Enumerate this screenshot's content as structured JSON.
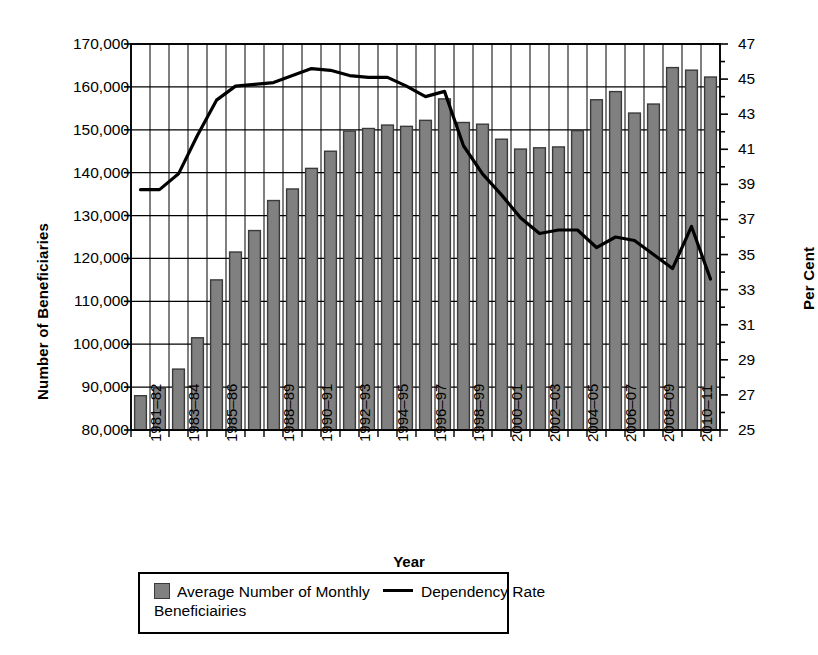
{
  "chart_data": {
    "type": "bar",
    "title": "",
    "xlabel": "Year",
    "ylabel": "Number of Beneficiaries",
    "y2label": "Per Cent",
    "grid": true,
    "legend_position": "bottom",
    "categories": [
      "1981–82",
      "1982–83",
      "1983–84",
      "1984–85",
      "1985–86",
      "1986–87",
      "1987–88",
      "1988–89",
      "1989–90",
      "1990–91",
      "1991–92",
      "1992–93",
      "1993–94",
      "1994–95",
      "1995–96",
      "1996–97",
      "1997–98",
      "1998–99",
      "1999–00",
      "2000–01",
      "2001–02",
      "2002–03",
      "2003–04",
      "2004–05",
      "2005–06",
      "2006–07",
      "2007–08",
      "2008–09",
      "2009–10",
      "2010–11",
      "2011–12"
    ],
    "xtick_labels": [
      "1981–82",
      "1983–84",
      "1985–86",
      "1988–89",
      "1990–91",
      "1992–93",
      "1994–95",
      "1996–97",
      "1998–99",
      "2000–01",
      "2002–03",
      "2004–05",
      "2006–07",
      "2008–09",
      "2010–11"
    ],
    "xtick_indices": [
      0,
      2,
      4,
      7,
      9,
      11,
      13,
      15,
      17,
      19,
      21,
      23,
      25,
      27,
      29
    ],
    "ylim": [
      80000,
      170000
    ],
    "ytick_values": [
      80000,
      90000,
      100000,
      110000,
      120000,
      130000,
      140000,
      150000,
      160000,
      170000
    ],
    "ytick_labels": [
      "80,000",
      "90,000",
      "100,000",
      "110,000",
      "120,000",
      "130,000",
      "140,000",
      "150,000",
      "160,000",
      "170,000"
    ],
    "y2lim": [
      25,
      47
    ],
    "y2tick_values": [
      25,
      27,
      29,
      31,
      33,
      35,
      37,
      39,
      41,
      43,
      45,
      47
    ],
    "y2tick_labels": [
      "25",
      "27",
      "29",
      "31",
      "33",
      "35",
      "37",
      "39",
      "41",
      "43",
      "45",
      "47"
    ],
    "y2_minor_step": 1,
    "series": [
      {
        "name": "Average Number of Monthly Beneficiairies",
        "type": "bar",
        "axis": "left",
        "color": "#808080",
        "edge_color": "#3a3a3a",
        "values": [
          88000,
          89800,
          94200,
          101500,
          115000,
          121500,
          126500,
          133500,
          136200,
          141000,
          145000,
          149700,
          150300,
          151100,
          150800,
          152200,
          157200,
          151700,
          151300,
          147800,
          145500,
          145800,
          146000,
          149800,
          157000,
          158900,
          153900,
          156000,
          164500,
          163900,
          162300
        ]
      },
      {
        "name": "Dependency Rate",
        "type": "line",
        "axis": "right",
        "color": "#000000",
        "values": [
          38.7,
          38.7,
          39.6,
          41.8,
          43.8,
          44.6,
          44.7,
          44.8,
          45.2,
          45.6,
          45.5,
          45.2,
          45.1,
          45.1,
          44.6,
          44.0,
          44.3,
          41.2,
          39.6,
          38.4,
          37.1,
          36.2,
          36.4,
          36.4,
          35.4,
          36.0,
          35.8,
          35.0,
          34.2,
          36.6,
          33.6
        ]
      }
    ]
  },
  "legend": {
    "entries": [
      {
        "label": "Average Number of Monthly Beneficiairies",
        "marker": "bar-swatch"
      },
      {
        "label": "Dependency Rate",
        "marker": "line-swatch"
      }
    ]
  },
  "axes": {
    "y_left_title": "Number of Beneficiaries",
    "y_right_title": "Per Cent",
    "x_title": "Year"
  }
}
